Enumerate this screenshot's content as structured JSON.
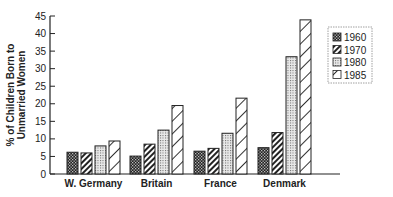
{
  "chart_data": {
    "type": "bar",
    "title": "",
    "xlabel": "",
    "ylabel": [
      "% of Children Born to",
      "Unmarried Women"
    ],
    "ylim": [
      0,
      45
    ],
    "yticks": [
      0,
      5,
      10,
      15,
      20,
      25,
      30,
      35,
      40,
      45
    ],
    "categories": [
      "W. Germany",
      "Britain",
      "France",
      "Denmark"
    ],
    "series": [
      {
        "name": "1960",
        "pattern": "checker-dark",
        "values": [
          6.2,
          5.1,
          6.5,
          7.5
        ]
      },
      {
        "name": "1970",
        "pattern": "hatch-dense",
        "values": [
          6.0,
          8.5,
          7.3,
          11.8
        ]
      },
      {
        "name": "1980",
        "pattern": "dots-light",
        "values": [
          8.0,
          12.5,
          11.6,
          33.4
        ]
      },
      {
        "name": "1985",
        "pattern": "hatch-sparse",
        "values": [
          9.4,
          19.5,
          21.6,
          43.9
        ]
      }
    ],
    "grid": false,
    "legend": {
      "placement": "top-right",
      "entries": [
        "1960",
        "1970",
        "1980",
        "1985"
      ]
    }
  }
}
